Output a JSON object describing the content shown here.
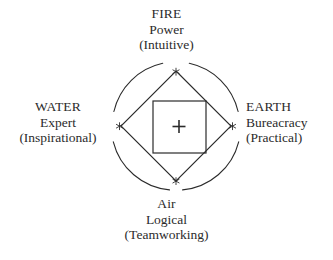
{
  "diagram": {
    "title_present": false,
    "background_color": "#ffffff",
    "stroke_color": "#2b2b2b",
    "text_color": "#2b2b2b",
    "center_marker": "+",
    "vertex_marker": "*",
    "shapes": {
      "outer_circle": "broken-circle",
      "middle_shape": "diamond",
      "inner_shape": "square"
    }
  },
  "labels": {
    "north": {
      "name": "FIRE",
      "role": "Power",
      "style": "(Intuitive)"
    },
    "west": {
      "name": "WATER",
      "role": "Expert",
      "style": "(Inspirational)"
    },
    "east": {
      "name": "EARTH",
      "role": "Bureacracy",
      "style": "(Practical)"
    },
    "south": {
      "name": "Air",
      "role": "Logical",
      "style": "(Teamworking)"
    }
  }
}
